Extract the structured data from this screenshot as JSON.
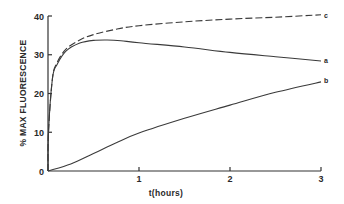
{
  "chart_data": {
    "type": "line",
    "title": "",
    "xlabel": "t(hours)",
    "ylabel": "% MAX FLUORESCENCE",
    "xlim": [
      0,
      3
    ],
    "ylim": [
      0,
      40
    ],
    "x_ticks": [
      "1",
      "2",
      "3"
    ],
    "y_ticks": [
      "0",
      "10",
      "20",
      "30",
      "40"
    ],
    "grid": false,
    "legend": "inline labels at right end of curves",
    "series": [
      {
        "name": "c",
        "style": "dashed",
        "x": [
          0,
          0.05,
          0.1,
          0.2,
          0.35,
          0.5,
          0.75,
          1.0,
          1.5,
          2.0,
          2.5,
          3.0
        ],
        "y": [
          18,
          24,
          28,
          31.5,
          33.8,
          35.2,
          36.6,
          37.5,
          38.5,
          39.2,
          39.7,
          40.3
        ]
      },
      {
        "name": "a",
        "style": "solid",
        "x": [
          0,
          0.05,
          0.1,
          0.2,
          0.35,
          0.5,
          0.65,
          0.8,
          1.0,
          1.5,
          2.0,
          2.5,
          3.0
        ],
        "y": [
          18,
          24,
          27.5,
          31,
          33,
          33.7,
          33.8,
          33.6,
          33.1,
          32,
          30.6,
          29.5,
          28.4
        ]
      },
      {
        "name": "b",
        "style": "solid",
        "x": [
          0,
          0.25,
          0.5,
          0.75,
          1.0,
          1.5,
          2.0,
          2.5,
          3.0
        ],
        "y": [
          0,
          1.8,
          4.5,
          7.3,
          9.8,
          13.6,
          17,
          20.3,
          23
        ]
      }
    ]
  },
  "axes": {
    "xlabel": "t(hours)",
    "ylabel": "% MAX FLUORESCENCE",
    "x_tick_labels": [
      "1",
      "2",
      "3"
    ],
    "y_tick_labels": [
      "0",
      "10",
      "20",
      "30",
      "40"
    ]
  },
  "curve_labels": {
    "c": "c",
    "a": "a",
    "b": "b"
  }
}
